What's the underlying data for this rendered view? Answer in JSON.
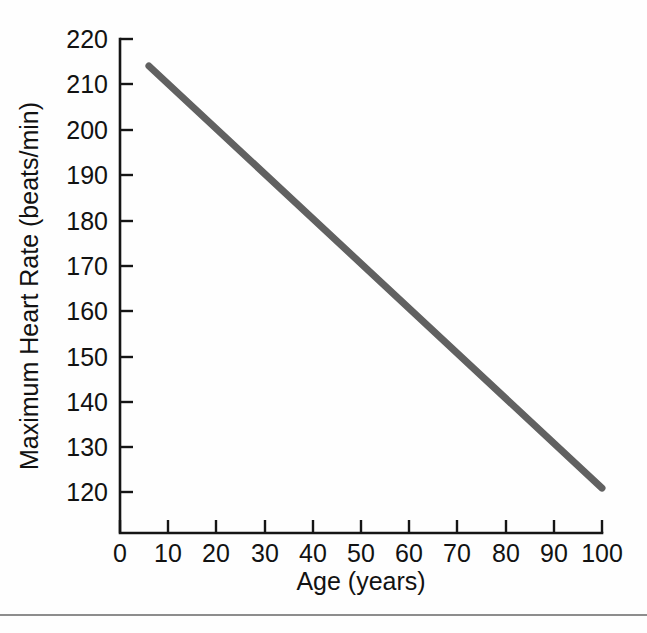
{
  "figure": {
    "background_color": "#fefefe",
    "footer_rule_color": "#8d8d8d"
  },
  "chart_data": {
    "type": "line",
    "title": "",
    "subtitle": "",
    "xlabel": "Age (years)",
    "ylabel": "Maximum Heart Rate (beats/min)",
    "xlim": [
      0,
      100
    ],
    "ylim": [
      110,
      220
    ],
    "xticks": [
      0,
      10,
      20,
      30,
      40,
      50,
      60,
      70,
      80,
      90,
      100
    ],
    "xtick_labels": [
      "0",
      "10",
      "20",
      "30",
      "40",
      "50",
      "60",
      "70",
      "80",
      "90",
      "100"
    ],
    "yticks": [
      120,
      130,
      140,
      150,
      160,
      170,
      180,
      190,
      200,
      210,
      220
    ],
    "ytick_labels": [
      "120",
      "130",
      "140",
      "150",
      "160",
      "170",
      "180",
      "190",
      "200",
      "210",
      "220"
    ],
    "grid": false,
    "legend": null,
    "annotations": [],
    "series": [
      {
        "name": "Maximum heart rate",
        "color": "#616161",
        "line_width": 7,
        "x": [
          6,
          100
        ],
        "y": [
          214,
          120
        ],
        "points": [
          {
            "x": 6,
            "y": 214
          },
          {
            "x": 10,
            "y": 210
          },
          {
            "x": 20,
            "y": 200
          },
          {
            "x": 30,
            "y": 190
          },
          {
            "x": 40,
            "y": 180
          },
          {
            "x": 50,
            "y": 170
          },
          {
            "x": 60,
            "y": 160
          },
          {
            "x": 70,
            "y": 150
          },
          {
            "x": 80,
            "y": 140
          },
          {
            "x": 90,
            "y": 130
          },
          {
            "x": 100,
            "y": 120
          }
        ]
      }
    ]
  }
}
